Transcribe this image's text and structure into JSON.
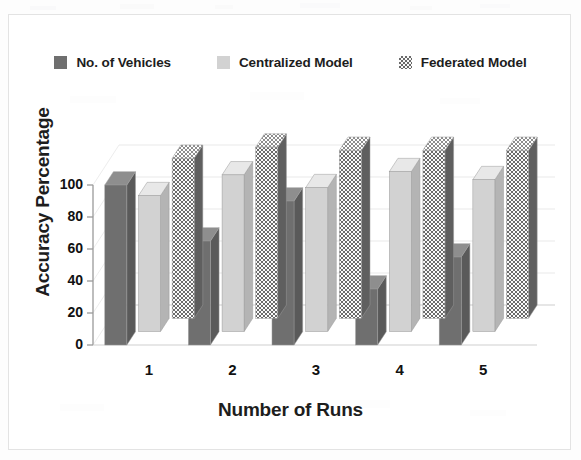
{
  "chart_data": {
    "type": "bar",
    "title": "",
    "subtitle": "",
    "xlabel": "Number of Runs",
    "ylabel": "Accuracy Percentage",
    "categories": [
      "1",
      "2",
      "3",
      "4",
      "5"
    ],
    "series": [
      {
        "name": "No. of Vehicles",
        "values": [
          100,
          65,
          90,
          35,
          55
        ],
        "color": "#6f6f6f",
        "pattern": "solid-dark"
      },
      {
        "name": "Centralized Model",
        "values": [
          85,
          98,
          90,
          100,
          95
        ],
        "color": "#d2d2d2",
        "pattern": "solid-light"
      },
      {
        "name": "Federated Model",
        "values": [
          100,
          107,
          105,
          105,
          105
        ],
        "color": "#6a6a6a",
        "pattern": "checker"
      }
    ],
    "ylim": [
      0,
      100
    ],
    "yticks": [
      0,
      20,
      40,
      60,
      80,
      100
    ],
    "ytick_labels": [
      "0",
      "20",
      "40",
      "60",
      "80",
      "100"
    ],
    "grid": true,
    "grid_axis": "y",
    "legend_position": "top",
    "three_d": true
  },
  "legend": {
    "entries": [
      {
        "label": "No. of Vehicles",
        "swatch": "solid-dark-square-icon"
      },
      {
        "label": "Centralized Model",
        "swatch": "solid-light-square-icon"
      },
      {
        "label": "Federated Model",
        "swatch": "checkered-square-icon"
      }
    ]
  },
  "axes": {
    "y_title": "Accuracy Percentage",
    "x_title": "Number of Runs",
    "y_ticks": [
      "0",
      "20",
      "40",
      "60",
      "80",
      "100"
    ],
    "x_ticks": [
      "1",
      "2",
      "3",
      "4",
      "5"
    ]
  },
  "colors": {
    "bar_dark_front": "#6f6f6f",
    "bar_dark_top": "#8e8e8e",
    "bar_dark_side": "#5a5a5a",
    "bar_light_front": "#d2d2d2",
    "bar_light_top": "#e8e8e8",
    "bar_light_side": "#b4b4b4",
    "bar_checker_fg": "#6a6a6a",
    "bar_checker_bg": "#fafafa",
    "axis": "#9a9a9a",
    "grid": "#e9e9e9",
    "text": "#111111",
    "frame": "#e3e3e3"
  }
}
